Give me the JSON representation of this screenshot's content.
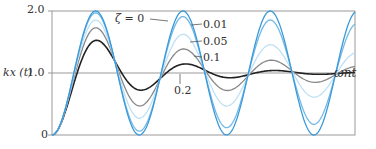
{
  "chart_data": {
    "type": "line",
    "title": "",
    "xlabel": "ω_n t",
    "ylabel": "kx(t)",
    "yticks": [
      "0",
      "1.0",
      "2.0"
    ],
    "ylim": [
      0,
      2.0
    ],
    "grid": false,
    "series": [
      {
        "name": "ζ = 0",
        "color": "#3a9ad9",
        "peak": 2.0
      },
      {
        "name": "0.01",
        "color": "#6fb7e6",
        "peak": 1.94
      },
      {
        "name": "0.05",
        "color": "#b9dcf2",
        "peak": 1.85
      },
      {
        "name": "0.1",
        "color": "#888888",
        "peak": 1.73
      },
      {
        "name": "0.2",
        "color": "#222222",
        "peak": 1.53
      }
    ]
  },
  "labels": {
    "ylabel": "kx (t)",
    "y_2": "2.0",
    "y_1": "1.0",
    "y_0": "0",
    "xlabel": "ωnt",
    "zeta0": "ζ = 0",
    "z001": "0.01",
    "z005": "0.05",
    "z01": "0.1",
    "z02": "0.2"
  }
}
